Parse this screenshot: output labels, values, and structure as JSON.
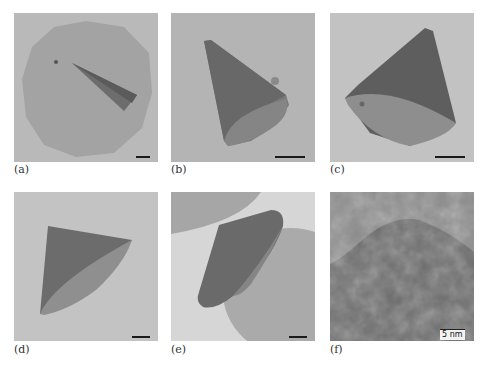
{
  "figure": {
    "panels": [
      {
        "id": "a",
        "label": "(a)",
        "description": "TEM image of a thin triangular/cone-shaped nanocrystal lying on a large circular support film",
        "scale_bar": ""
      },
      {
        "id": "b",
        "label": "(b)",
        "description": "TEM image of a cone-shaped nanocrystal with a small particle attached near its rim",
        "scale_bar": ""
      },
      {
        "id": "c",
        "label": "(c)",
        "description": "TEM image of a cone-shaped nanocrystal viewed obliquely showing its circular base",
        "scale_bar": ""
      },
      {
        "id": "d",
        "label": "(d)",
        "description": "TEM image of a cone-shaped nanocrystal with curved base edge",
        "scale_bar": ""
      },
      {
        "id": "e",
        "label": "(e)",
        "description": "TEM image of a truncated cone-shaped nanocrystal between two circular support regions",
        "scale_bar": ""
      },
      {
        "id": "f",
        "label": "(f)",
        "description": "High-resolution TEM image showing lattice fringes at the edge of a nanocrystal",
        "scale_bar": "5 nm"
      }
    ]
  }
}
